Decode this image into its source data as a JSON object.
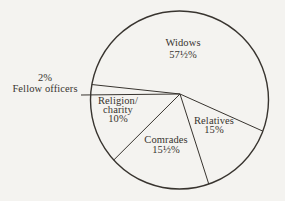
{
  "figure": {
    "background_color": "#f4f3f0",
    "ink_color": "#38342f"
  },
  "chart_data": {
    "type": "pie",
    "title": "",
    "categories": [
      "Widows",
      "Relatives",
      "Comrades",
      "Religion/charity",
      "Fellow officers"
    ],
    "values": [
      57.5,
      15,
      15.5,
      10,
      2
    ],
    "value_labels": [
      "57½%",
      "15%",
      "15½%",
      "10%",
      "2%"
    ],
    "total": 100,
    "legend_position": "none",
    "label_placement": "inside slices; 2% Fellow officers slice labeled outside circle with leader line"
  },
  "labels": {
    "widows": {
      "line1": "Widows",
      "line2": "57½%"
    },
    "fellow": {
      "line1": "2%",
      "line2": "Fellow officers"
    },
    "religion": {
      "line1": "Religion/",
      "line2": "charity",
      "line3": "10%"
    },
    "comrades": {
      "line1": "Comrades",
      "line2": "15½%"
    },
    "relatives": {
      "line1": "Relatives",
      "line2": "15%"
    }
  }
}
